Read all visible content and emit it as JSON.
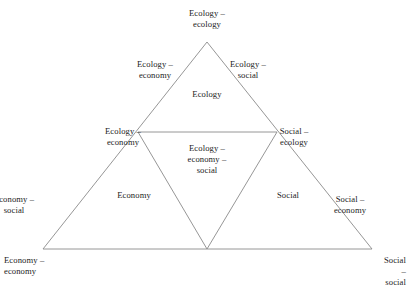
{
  "diagram": {
    "line_color": "#8a8a8a",
    "text_color": "#1c1c1c",
    "background": "#ffffff",
    "corners": {
      "apex": "Ecology –\necology",
      "bottom_left": "Economy –\neconomy",
      "bottom_right": "Social –\nsocial"
    },
    "edges": {
      "ecology_economy_upper": "Ecology –\neconomy",
      "ecology_social_upper": "Ecology –\nsocial",
      "ecology_economy_mid": "Ecology –\neconomy",
      "social_ecology": "Social –\necology",
      "economy_social": "Economy –\nsocial",
      "social_economy": "Social –\neconomy"
    },
    "regions": {
      "ecology": "Ecology",
      "economy": "Economy",
      "social": "Social",
      "center": "Ecology –\neconomy –\nsocial"
    }
  }
}
